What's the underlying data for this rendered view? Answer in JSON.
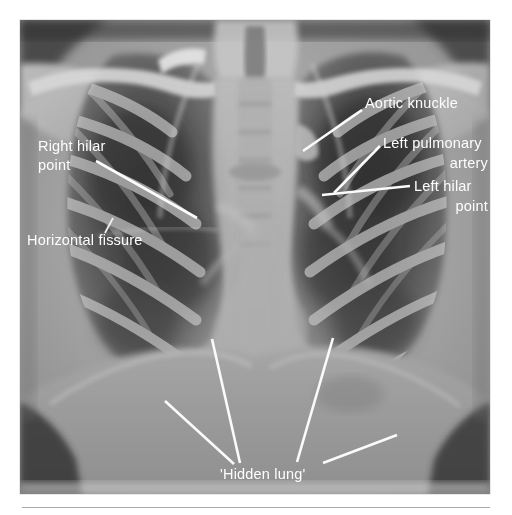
{
  "figure": {
    "kind": "annotated-chest-radiograph",
    "modality": "Chest X-ray (PA)",
    "background_color": "#ffffff",
    "plate_color": "#8c8c8c",
    "annotation_color": "#fbfbfb",
    "plate": {
      "x": 20,
      "y": 20,
      "width": 470,
      "height": 474
    }
  },
  "annotations": {
    "right_hilar_point": {
      "label_line_1": "Right hilar",
      "label_line_2": "point",
      "x": 38,
      "y": 151,
      "line_height": 19,
      "anchor": "start",
      "leader": {
        "x1": 96,
        "y1": 161,
        "x2": 197,
        "y2": 218
      }
    },
    "horizontal_fissure": {
      "label_line_1": "Horizontal fissure",
      "x": 27,
      "y": 245,
      "anchor": "start",
      "leader": {
        "x1": 113,
        "y1": 218,
        "x2": 105,
        "y2": 233
      }
    },
    "aortic_knuckle": {
      "label_line_1": "Aortic knuckle",
      "x": 365,
      "y": 108,
      "anchor": "start",
      "leader": {
        "x1": 303,
        "y1": 151,
        "x2": 362,
        "y2": 110
      }
    },
    "left_pulmonary_artery": {
      "label_line_1": "Left pulmonary",
      "label_line_2": "artery",
      "x": 383,
      "y": 148,
      "x2_right": 488,
      "line_height": 20,
      "anchor": "start",
      "leader": {
        "x1": 334,
        "y1": 193,
        "x2": 380,
        "y2": 146
      }
    },
    "left_hilar_point": {
      "label_line_1": "Left hilar",
      "label_line_2": "point",
      "x": 414,
      "y": 191,
      "x2_right": 488,
      "line_height": 20,
      "anchor": "start",
      "leader": {
        "x1": 322,
        "y1": 195,
        "x2": 410,
        "y2": 186
      }
    },
    "hidden_lung": {
      "label_line_1": "'Hidden lung'",
      "x": 220,
      "y": 479,
      "anchor": "start",
      "leaders": [
        {
          "x1": 165,
          "y1": 401,
          "x2": 234,
          "y2": 464
        },
        {
          "x1": 212,
          "y1": 339,
          "x2": 240,
          "y2": 463
        },
        {
          "x1": 333,
          "y1": 338,
          "x2": 297,
          "y2": 462
        },
        {
          "x1": 397,
          "y1": 435,
          "x2": 323,
          "y2": 463
        }
      ]
    }
  },
  "anatomy_regions": [
    {
      "name": "right-lung-field",
      "tone": "#5a5a5a"
    },
    {
      "name": "left-lung-field",
      "tone": "#565656"
    },
    {
      "name": "mediastinum",
      "tone": "#b4b4b4"
    },
    {
      "name": "clavicle",
      "tone": "#d2d2d2"
    },
    {
      "name": "rib-cage",
      "tone": "#b0b0b0"
    },
    {
      "name": "diaphragm",
      "tone": "#a8a8a8"
    },
    {
      "name": "spine",
      "tone": "#a0a0a0"
    },
    {
      "name": "soft-tissue-shoulder",
      "tone": "#c4c4c4"
    }
  ]
}
